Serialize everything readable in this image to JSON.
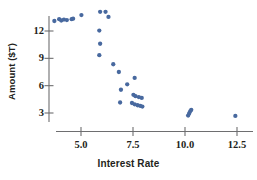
{
  "chart_data": {
    "type": "scatter",
    "title": "",
    "xlabel": "Interest Rate",
    "ylabel": "Amount ($T)",
    "xlim": [
      3.2,
      13.1
    ],
    "ylim": [
      1.9,
      14.4
    ],
    "grid": false,
    "legend": null,
    "marker_color": "#48699f",
    "axis_color": "#6e6e70",
    "xticks": [
      {
        "value": 5.0,
        "label": "5.0"
      },
      {
        "value": 7.5,
        "label": "7.5"
      },
      {
        "value": 10.0,
        "label": "10.0"
      },
      {
        "value": 12.5,
        "label": "12.5"
      }
    ],
    "yticks": [
      {
        "value": 3,
        "label": "3"
      },
      {
        "value": 6,
        "label": "6"
      },
      {
        "value": 9,
        "label": "9"
      },
      {
        "value": 12,
        "label": "12"
      }
    ],
    "series": [
      {
        "name": "observations",
        "points": [
          [
            3.72,
            13.1
          ],
          [
            3.95,
            13.3
          ],
          [
            4.05,
            13.15
          ],
          [
            4.18,
            13.25
          ],
          [
            4.32,
            13.2
          ],
          [
            4.55,
            13.3
          ],
          [
            4.62,
            13.35
          ],
          [
            5.02,
            13.75
          ],
          [
            5.92,
            14.1
          ],
          [
            6.18,
            14.1
          ],
          [
            6.32,
            13.55
          ],
          [
            5.88,
            12.05
          ],
          [
            5.92,
            10.6
          ],
          [
            5.88,
            9.35
          ],
          [
            6.55,
            8.35
          ],
          [
            6.82,
            7.5
          ],
          [
            7.58,
            6.85
          ],
          [
            7.22,
            6.15
          ],
          [
            6.92,
            5.55
          ],
          [
            7.52,
            5.0
          ],
          [
            7.62,
            4.85
          ],
          [
            7.78,
            4.75
          ],
          [
            7.92,
            4.65
          ],
          [
            6.88,
            4.15
          ],
          [
            7.45,
            4.1
          ],
          [
            7.58,
            3.95
          ],
          [
            7.72,
            3.85
          ],
          [
            7.85,
            3.78
          ],
          [
            7.95,
            3.7
          ],
          [
            10.15,
            2.72
          ],
          [
            10.2,
            2.95
          ],
          [
            10.25,
            3.18
          ],
          [
            10.3,
            3.35
          ],
          [
            12.42,
            2.68
          ]
        ]
      }
    ]
  }
}
